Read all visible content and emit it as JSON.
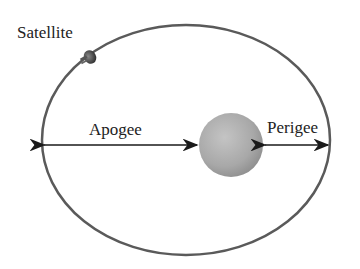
{
  "diagram": {
    "type": "orbit",
    "labels": {
      "satellite": "Satellite",
      "apogee": "Apogee",
      "perigee": "Perigee"
    },
    "colors": {
      "orbit": "#5a5a5a",
      "planet": "#a9a9a9",
      "arrows": "#1a1a1a",
      "background": "#ffffff"
    }
  }
}
